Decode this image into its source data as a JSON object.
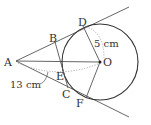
{
  "diagram": {
    "type": "geometry",
    "colors": {
      "stroke": "#444444",
      "dotted": "#999999",
      "background": "#ffffff"
    },
    "points": {
      "A": {
        "label": "A",
        "x": 16,
        "y": 61
      },
      "B": {
        "label": "B",
        "x": 55,
        "y": 42
      },
      "C": {
        "label": "C",
        "x": 68,
        "y": 88
      },
      "D": {
        "label": "D",
        "x": 83,
        "y": 27
      },
      "E": {
        "label": "E",
        "x": 62,
        "y": 67
      },
      "F": {
        "label": "F",
        "x": 86,
        "y": 97
      },
      "O": {
        "label": "O",
        "x": 100,
        "y": 62
      }
    },
    "circle": {
      "center": "O",
      "radius": 38
    },
    "measurements": {
      "radius_label": "5 cm",
      "AO_label": "13 cm"
    }
  }
}
